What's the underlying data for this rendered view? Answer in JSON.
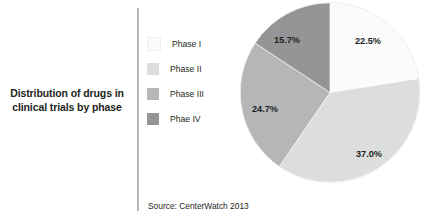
{
  "figure": {
    "title": "Distribution of drugs in clinical trials by phase",
    "title_line_1": "Distribution of drugs in",
    "title_line_2": "clinical trials by phase",
    "source": "Source: CenterWatch 2013"
  },
  "legend": {
    "items": [
      {
        "label": "Phase I",
        "color": "#fbfbfb"
      },
      {
        "label": "Phase II",
        "color": "#dcdddd"
      },
      {
        "label": "Phase III",
        "color": "#b5b6b7"
      },
      {
        "label": "Phae IV",
        "color": "#949596"
      }
    ]
  },
  "chart_data": {
    "type": "pie",
    "title": "Distribution of drugs in clinical trials by phase",
    "xlabel": "",
    "ylabel": "",
    "categories": [
      "Phase I",
      "Phase II",
      "Phase III",
      "Phae IV"
    ],
    "values": [
      22.5,
      37.0,
      24.7,
      15.7
    ],
    "value_labels": [
      "22.5%",
      "37.0%",
      "24.7%",
      "15.7%"
    ],
    "colors": [
      "#fbfbfb",
      "#dcdddd",
      "#b5b6b7",
      "#949596"
    ],
    "units": "percent",
    "total": 99.9,
    "start_angle_deg": 0,
    "direction": "clockwise",
    "legend_position": "left",
    "grid": false,
    "source": "Source: CenterWatch 2013",
    "slices": [
      {
        "name": "Phase I",
        "value": 22.5,
        "label": "22.5%",
        "color": "#fbfbfb",
        "label_x": 128,
        "label_y": 42
      },
      {
        "name": "Phase II",
        "value": 37.0,
        "label": "37.0%",
        "color": "#dcdddd",
        "label_x": 129,
        "label_y": 155
      },
      {
        "name": "Phase III",
        "value": 24.7,
        "label": "24.7%",
        "color": "#b5b6b7",
        "label_x": 25,
        "label_y": 110
      },
      {
        "name": "Phae IV",
        "value": 15.7,
        "label": "15.7%",
        "color": "#949596",
        "label_x": 47,
        "label_y": 41
      }
    ]
  }
}
